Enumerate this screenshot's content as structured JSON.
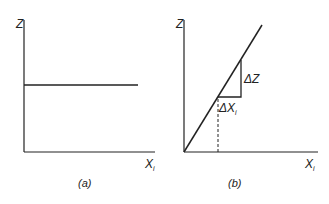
{
  "panels": [
    {
      "id": "a",
      "caption": "(a)",
      "y_axis_label": "Z",
      "x_axis_label": "X",
      "x_axis_subscript": "i",
      "curve": "horizontal line (constant Z)"
    },
    {
      "id": "b",
      "caption": "(b)",
      "y_axis_label": "Z",
      "x_axis_label": "X",
      "x_axis_subscript": "i",
      "curve": "straight line through origin",
      "annotations": {
        "delta_z": "ΔZ",
        "delta_x": "ΔX",
        "delta_x_subscript": "i"
      }
    }
  ],
  "colors": {
    "line": "#222222",
    "background": "#ffffff"
  }
}
